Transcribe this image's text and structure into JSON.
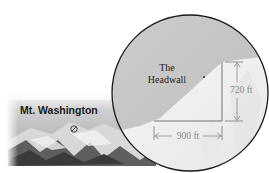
{
  "figure": {
    "photo_label": "Mt. Washington",
    "inset": {
      "feature_label_line1": "The",
      "feature_label_line2": "Headwall",
      "vertical_dimension": "720 ft",
      "horizontal_dimension": "900 ft"
    }
  },
  "colors": {
    "sky_gray": "#c6c6c6",
    "snow_white": "#f2f2f2",
    "circle_outline": "#1a1a1a",
    "dimension_line": "#8a8a8a",
    "right_triangle_line": "#555555"
  }
}
